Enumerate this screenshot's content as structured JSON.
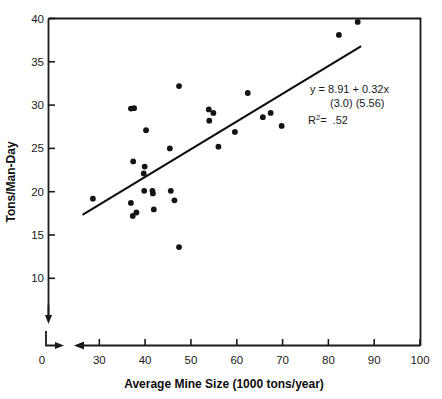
{
  "chart_data": {
    "type": "scatter",
    "title": "",
    "xlabel": "Average Mine Size (1000 tons/year)",
    "ylabel": "Tons/Man-Day",
    "xlim": [
      25,
      100
    ],
    "ylim": [
      8.5,
      40
    ],
    "grid": false,
    "legend_position": "none",
    "x_ticks": [
      30,
      40,
      50,
      60,
      70,
      80,
      90,
      100
    ],
    "x_tick_labels": [
      "30",
      "40",
      "50",
      "60",
      "70",
      "80",
      "90",
      "100"
    ],
    "x_origin_label": "0",
    "y_ticks": [
      10,
      15,
      20,
      25,
      30,
      35,
      40
    ],
    "y_tick_labels": [
      "10",
      "15",
      "20",
      "25",
      "30",
      "35",
      "40"
    ],
    "axis_break": true,
    "points": [
      {
        "x": 28.6,
        "y": 19.2
      },
      {
        "x": 36.9,
        "y": 29.6
      },
      {
        "x": 37.6,
        "y": 29.65
      },
      {
        "x": 40.2,
        "y": 27.1
      },
      {
        "x": 37.4,
        "y": 23.5
      },
      {
        "x": 39.9,
        "y": 22.9
      },
      {
        "x": 39.7,
        "y": 22.1
      },
      {
        "x": 36.9,
        "y": 18.7
      },
      {
        "x": 37.3,
        "y": 17.2
      },
      {
        "x": 38.1,
        "y": 17.6
      },
      {
        "x": 39.8,
        "y": 20.1
      },
      {
        "x": 41.6,
        "y": 20.1
      },
      {
        "x": 41.7,
        "y": 19.8
      },
      {
        "x": 41.9,
        "y": 17.95
      },
      {
        "x": 45.4,
        "y": 25.0
      },
      {
        "x": 45.6,
        "y": 20.1
      },
      {
        "x": 46.4,
        "y": 19.0
      },
      {
        "x": 47.4,
        "y": 32.2
      },
      {
        "x": 47.4,
        "y": 13.6
      },
      {
        "x": 53.9,
        "y": 29.5
      },
      {
        "x": 54.0,
        "y": 28.2
      },
      {
        "x": 54.9,
        "y": 29.1
      },
      {
        "x": 56.0,
        "y": 25.2
      },
      {
        "x": 59.6,
        "y": 26.9
      },
      {
        "x": 62.4,
        "y": 31.4
      },
      {
        "x": 65.7,
        "y": 28.6
      },
      {
        "x": 67.4,
        "y": 29.1
      },
      {
        "x": 69.8,
        "y": 27.6
      },
      {
        "x": 82.3,
        "y": 38.1
      },
      {
        "x": 86.4,
        "y": 39.6
      }
    ],
    "fit_line": {
      "slope": 0.32,
      "intercept": 8.91,
      "x_start": 26.5,
      "x_end": 87.0
    },
    "annotation": {
      "equation": "y  =  8.91  +  0.32x",
      "std_errors": "(3.0)        (5.56)",
      "r_squared_label": "R",
      "r_squared_exponent": "2",
      "r_squared_value": "=  .52"
    }
  },
  "colors": {
    "point": "#141414",
    "line": "#0d0d0d",
    "axis": "#1a1a1a",
    "background": "#ffffff"
  }
}
